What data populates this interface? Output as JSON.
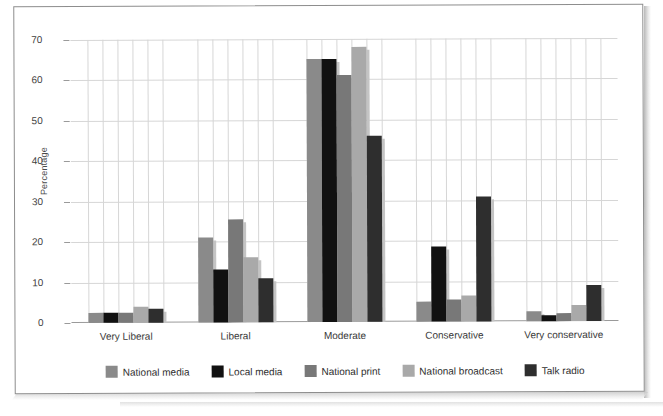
{
  "chart_data": {
    "type": "bar",
    "title": "",
    "xlabel": "",
    "ylabel": "Percentage",
    "ylim": [
      0,
      70
    ],
    "yticks": [
      0,
      10,
      20,
      30,
      40,
      50,
      60,
      70
    ],
    "grid": true,
    "legend_position": "bottom",
    "categories": [
      "Very Liberal",
      "Liberal",
      "Moderate",
      "Conservative",
      "Very conservative"
    ],
    "series": [
      {
        "name": "National media",
        "color": "#8a8a8a",
        "values": [
          2.5,
          21.0,
          65.0,
          5.0,
          2.5
        ]
      },
      {
        "name": "Local media",
        "color": "#111111",
        "values": [
          2.5,
          13.0,
          65.0,
          18.5,
          1.5
        ]
      },
      {
        "name": "National print",
        "color": "#787878",
        "values": [
          2.5,
          25.5,
          61.0,
          5.5,
          2.0
        ]
      },
      {
        "name": "National broadcast",
        "color": "#a9a9a9",
        "values": [
          4.0,
          16.0,
          68.0,
          6.5,
          4.0
        ]
      },
      {
        "name": "Talk radio",
        "color": "#2e2e2e",
        "values": [
          3.5,
          11.0,
          46.0,
          31.0,
          9.0
        ]
      }
    ]
  },
  "axis": {
    "y_title": "Percentage",
    "y_tick_labels": [
      "0",
      "10",
      "20",
      "30",
      "40",
      "50",
      "60",
      "70"
    ],
    "x_tick_labels": [
      "Very Liberal",
      "Liberal",
      "Moderate",
      "Conservative",
      "Very conservative"
    ]
  },
  "legend": {
    "items": [
      {
        "label": "National media",
        "color": "#8a8a8a"
      },
      {
        "label": "Local media",
        "color": "#111111"
      },
      {
        "label": "National print",
        "color": "#787878"
      },
      {
        "label": "National broadcast",
        "color": "#a9a9a9"
      },
      {
        "label": "Talk radio",
        "color": "#2e2e2e"
      }
    ]
  }
}
